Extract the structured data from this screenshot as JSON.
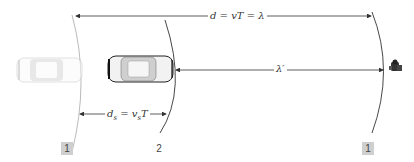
{
  "diagram": {
    "labels": {
      "d_top": "d = vT = λ",
      "ds": "d",
      "ds_sub": "s",
      "ds_eq": " = v",
      "ds_sub2": "s",
      "ds_T": "T",
      "lambda_prime": "λ′"
    },
    "wavefront_labels": [
      {
        "id": "left-wavefront",
        "text": "1",
        "boxed": true
      },
      {
        "id": "middle-wavefront",
        "text": "2",
        "boxed": false
      },
      {
        "id": "right-wavefront",
        "text": "1",
        "boxed": true
      }
    ],
    "objects": [
      {
        "id": "source-car-earlier",
        "icon": "car-icon",
        "state": "faded"
      },
      {
        "id": "source-car-current",
        "icon": "car-icon",
        "state": "solid"
      },
      {
        "id": "listener",
        "icon": "person-icon"
      }
    ],
    "colors": {
      "line": "#333333",
      "faded_arc": "#9a9a9a",
      "box": "#cfcfcf"
    }
  }
}
